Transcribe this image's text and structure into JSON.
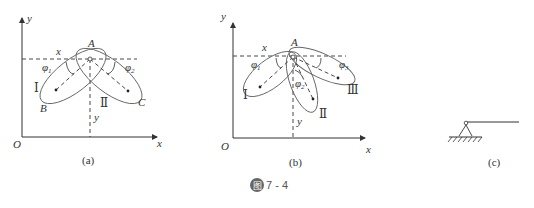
{
  "figure": {
    "badge": "图",
    "number": "7 - 4"
  },
  "panel_a": {
    "caption": "(a)",
    "origin": "O",
    "x_axis": "x",
    "y_axis": "y",
    "point_A": "A",
    "point_B": "B",
    "point_C": "C",
    "coord_x": "x",
    "coord_y": "y",
    "phi1": "φ",
    "phi1_sub": "1",
    "phi2": "φ",
    "phi2_sub": "2",
    "body1": "Ⅰ",
    "body2": "Ⅱ"
  },
  "panel_b": {
    "caption": "(b)",
    "origin": "O",
    "x_axis": "x",
    "y_axis": "y",
    "point_A": "A",
    "coord_x": "x",
    "coord_y": "y",
    "phi1": "φ",
    "phi1_sub": "1",
    "phi2": "φ",
    "phi2_sub": "2",
    "phi3": "φ",
    "phi3_sub": "3",
    "body1": "Ⅰ",
    "body2": "Ⅱ",
    "body3": "Ⅲ"
  },
  "panel_c": {
    "caption": "(c)"
  }
}
